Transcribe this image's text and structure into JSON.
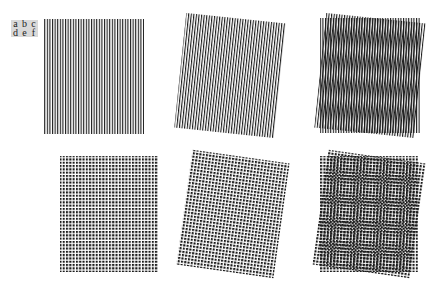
{
  "labels": [
    "a",
    "b",
    "c",
    "d",
    "e",
    "f"
  ],
  "colors": {
    "ink": "#1a1a1a",
    "background": "#ffffff",
    "label_bg": "#d9d9d9"
  },
  "panels": [
    {
      "id": "a",
      "kind": "lines",
      "x": 44,
      "y": 19,
      "w": 100,
      "h": 115,
      "rotate": 0,
      "pitch": 2.6,
      "stroke": 1.1
    },
    {
      "id": "b",
      "kind": "lines",
      "x": 180,
      "y": 18,
      "w": 100,
      "h": 115,
      "rotate": 6,
      "pitch": 2.6,
      "stroke": 1.1
    },
    {
      "id": "c",
      "kind": "lines-overlay",
      "x": 320,
      "y": 18,
      "w": 100,
      "h": 115,
      "rotate": 6,
      "pitch": 2.6,
      "stroke": 1.1
    },
    {
      "id": "d",
      "kind": "dots",
      "x": 60,
      "y": 156,
      "w": 98,
      "h": 116,
      "rotate": 0,
      "pitch": 3.3,
      "dot": 2.1
    },
    {
      "id": "e",
      "kind": "dots",
      "x": 184,
      "y": 156,
      "w": 98,
      "h": 116,
      "rotate": 8,
      "pitch": 3.3,
      "dot": 2.1
    },
    {
      "id": "f",
      "kind": "dots-overlay",
      "x": 320,
      "y": 156,
      "w": 98,
      "h": 116,
      "rotate": 8,
      "pitch": 3.3,
      "dot": 2.1
    }
  ]
}
